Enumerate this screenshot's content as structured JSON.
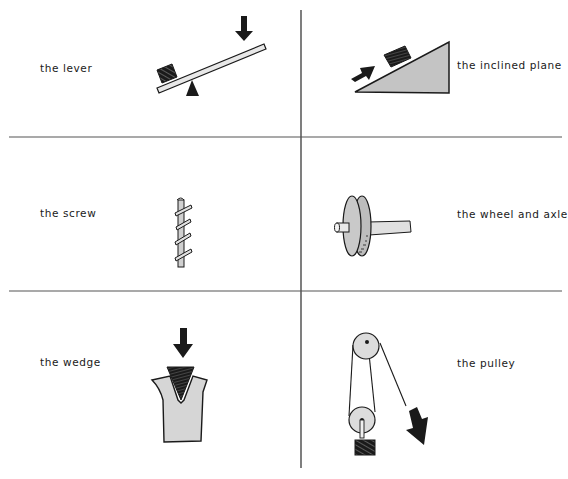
{
  "figure": {
    "layout": "3x2 grid",
    "colors": {
      "ink": "#1a1a1a",
      "gray_fill": "#c9c9c9",
      "light_fill": "#d9d9d9",
      "divider": "#444444"
    },
    "cells": [
      {
        "id": "lever",
        "label": "the lever",
        "row": 1,
        "col": 1
      },
      {
        "id": "inclined-plane",
        "label": "the inclined plane",
        "row": 1,
        "col": 2
      },
      {
        "id": "screw",
        "label": "the screw",
        "row": 2,
        "col": 1
      },
      {
        "id": "wheel-and-axle",
        "label": "the wheel and axle",
        "row": 2,
        "col": 2
      },
      {
        "id": "wedge",
        "label": "the wedge",
        "row": 3,
        "col": 1
      },
      {
        "id": "pulley",
        "label": "the pulley",
        "row": 3,
        "col": 2
      }
    ]
  }
}
